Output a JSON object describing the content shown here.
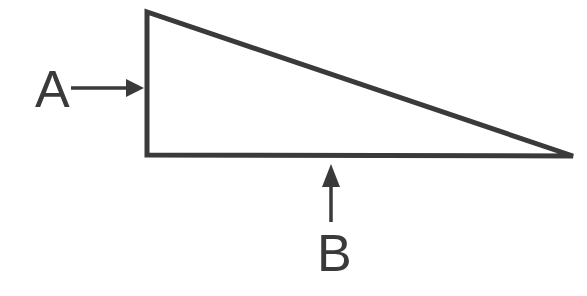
{
  "figure": {
    "background_color": "#ffffff",
    "stroke_color": "#3a3a3a",
    "width": 587,
    "height": 296
  },
  "shape": {
    "name": "right-triangle",
    "type": "polygon",
    "stroke_width": 5,
    "points": "147,12 147,155 573,156",
    "vertices": [
      {
        "name": "apex-top-left",
        "x": 147,
        "y": 12
      },
      {
        "name": "right-angle-bottom-left",
        "x": 147,
        "y": 155
      },
      {
        "name": "acute-bottom-right",
        "x": 573,
        "y": 156
      }
    ],
    "edges": [
      {
        "name": "vertical-leg",
        "label_ref": "A"
      },
      {
        "name": "horizontal-base",
        "label_ref": "B"
      },
      {
        "name": "hypotenuse",
        "label_ref": ""
      }
    ]
  },
  "annotations": [
    {
      "id": "A",
      "label": "A",
      "points_to": "vertical-leg",
      "direction": "right",
      "label_x": 35,
      "label_baseline_y": 107,
      "arrow": {
        "name": "arrow-a",
        "shaft_start_x": 71,
        "shaft_end_x": 129,
        "tip_x": 144,
        "y": 88,
        "head_half_height": 9,
        "head_length": 17
      }
    },
    {
      "id": "B",
      "label": "B",
      "points_to": "horizontal-base",
      "direction": "up",
      "label_x": 317,
      "label_baseline_y": 271,
      "arrow": {
        "name": "arrow-b",
        "shaft_start_y": 222,
        "shaft_end_y": 180,
        "tip_y": 164,
        "x": 331,
        "head_half_width": 9,
        "head_length": 22
      }
    }
  ]
}
